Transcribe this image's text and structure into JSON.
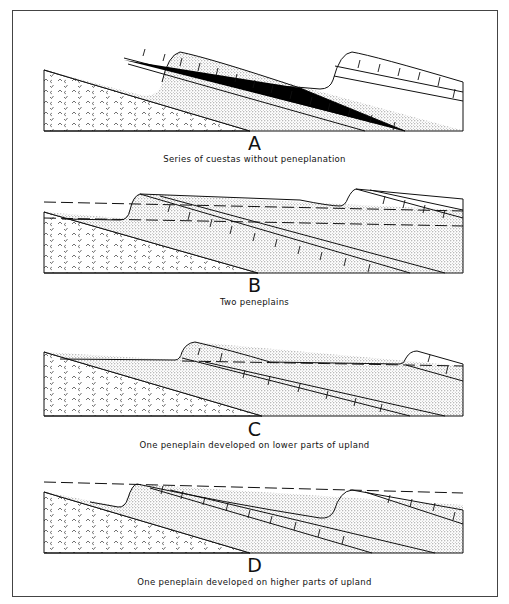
{
  "figure": {
    "panels": [
      {
        "letter": "A",
        "caption": "Series of cuestas without peneplanation",
        "peneplains": 0
      },
      {
        "letter": "B",
        "caption": "Two peneplains",
        "peneplains": 2
      },
      {
        "letter": "C",
        "caption": "One peneplain developed on lower parts of upland",
        "peneplains": 1
      },
      {
        "letter": "D",
        "caption": "One peneplain developed on higher parts of upland",
        "peneplains": 1
      }
    ],
    "legend_patterns": {
      "basement": "crystalline rock (v-marks)",
      "sandstone": "stippled",
      "limestone": "brick pattern"
    },
    "colors": {
      "ink": "#111111",
      "stipple": "#b9b9b9",
      "paper": "#ffffff"
    }
  }
}
